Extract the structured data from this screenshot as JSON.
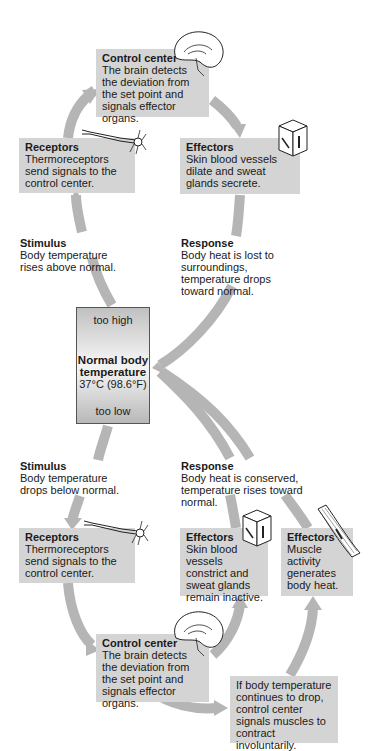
{
  "diagram": {
    "center": {
      "too_high": "too high",
      "title_line1": "Normal body",
      "title_line2": "temperature",
      "value": "37°C (98.6°F)",
      "too_low": "too low"
    },
    "upper_loop": {
      "control_center": {
        "title": "Control center",
        "text": "The brain detects the deviation from the set point and signals effector organs."
      },
      "receptors": {
        "title": "Receptors",
        "text": "Thermoreceptors send signals to the control center."
      },
      "effectors": {
        "title": "Effectors",
        "text": "Skin blood vessels dilate and sweat glands secrete."
      },
      "stimulus": {
        "title": "Stimulus",
        "text": "Body temperature rises above normal."
      },
      "response": {
        "title": "Response",
        "text": "Body heat is lost to surroundings, temperature drops toward normal."
      }
    },
    "lower_loop": {
      "stimulus": {
        "title": "Stimulus",
        "text": "Body temperature drops below normal."
      },
      "response": {
        "title": "Response",
        "text": "Body heat is conserved, temperature rises toward normal."
      },
      "receptors": {
        "title": "Receptors",
        "text": "Thermoreceptors send signals to the control center."
      },
      "effectors_skin": {
        "title": "Effectors",
        "text": "Skin blood vessels constrict and sweat glands remain inactive."
      },
      "effectors_muscle": {
        "title": "Effectors",
        "text": "Muscle activity generates body heat."
      },
      "control_center": {
        "title": "Control center",
        "text": "The brain detects the deviation from the set point and signals effector organs."
      },
      "shivering_note": {
        "text": "If body temperature continues to drop, control center signals muscles to contract involuntarily."
      }
    },
    "icons": [
      "brain-icon",
      "neuron-icon",
      "skin-block-icon",
      "muscle-fiber-icon"
    ],
    "colors": {
      "box_fill": "#d4d4d4",
      "arrow": "#b5b5b5",
      "text": "#1a1a1a"
    }
  }
}
